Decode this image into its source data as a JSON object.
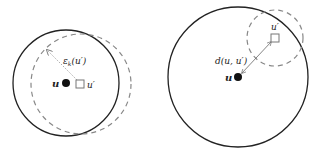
{
  "left_panel": {
    "solid_circle": {
      "cx": 66,
      "cy": 83,
      "r": 53,
      "color": "#222222"
    },
    "dashed_circle": {
      "cx": 81,
      "cy": 84,
      "r": 50,
      "color": "#888888"
    },
    "point_u": {
      "cx": 66,
      "cy": 83,
      "label": "u"
    },
    "point_u_prime": {
      "cx": 80,
      "cy": 84,
      "label": "u′"
    },
    "radius_label": {
      "symbol": "ε",
      "subscript": "k",
      "arg": "(u′)"
    }
  },
  "right_panel": {
    "solid_circle": {
      "cx": 238,
      "cy": 77,
      "r": 70,
      "color": "#222222"
    },
    "dashed_circle": {
      "cx": 275,
      "cy": 38,
      "r": 28,
      "color": "#888888"
    },
    "point_u": {
      "cx": 238,
      "cy": 77,
      "label": "u"
    },
    "point_u_prime": {
      "cx": 275,
      "cy": 38,
      "label": "u′"
    },
    "distance_label": "d(u, u′)"
  }
}
